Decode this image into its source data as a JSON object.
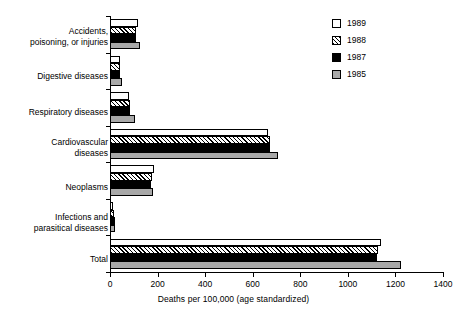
{
  "chart_data": {
    "type": "bar",
    "orientation": "horizontal",
    "title": "",
    "xlabel": "Deaths per 100,000 (age standardized)",
    "ylabel": "",
    "xlim": [
      0,
      1400
    ],
    "xticks": [
      0,
      200,
      400,
      600,
      800,
      1000,
      1200,
      1400
    ],
    "xticklabels": [
      "0",
      "200",
      "400",
      "600",
      "800",
      "1000",
      "1200",
      "1400"
    ],
    "grid": false,
    "legend_position": "top-right",
    "categories": [
      "Accidents,\npoisoning, or injuries",
      "Digestive diseases",
      "Respiratory diseases",
      "Cardiovascular\ndiseases",
      "Neoplasms",
      "Infections and\nparasitical diseases",
      "Total"
    ],
    "series": [
      {
        "name": "1989",
        "color": "#ffffff",
        "pattern": "open",
        "values": [
          118,
          40,
          78,
          664,
          186,
          14,
          1140
        ]
      },
      {
        "name": "1988",
        "color": "#ffffff",
        "pattern": "hatched",
        "values": [
          110,
          42,
          84,
          672,
          176,
          18,
          1128
        ]
      },
      {
        "name": "1987",
        "color": "#000000",
        "pattern": "solid",
        "values": [
          108,
          44,
          86,
          672,
          172,
          20,
          1124
        ]
      },
      {
        "name": "1985",
        "color": "#a8a8a8",
        "pattern": "solid",
        "values": [
          126,
          50,
          104,
          706,
          180,
          22,
          1222
        ]
      }
    ]
  },
  "legend": {
    "entries": [
      {
        "label": "1989",
        "swatch": "open-square-swatch"
      },
      {
        "label": "1988",
        "swatch": "hatched-square-swatch"
      },
      {
        "label": "1987",
        "swatch": "black-square-swatch"
      },
      {
        "label": "1985",
        "swatch": "gray-square-swatch"
      }
    ]
  }
}
